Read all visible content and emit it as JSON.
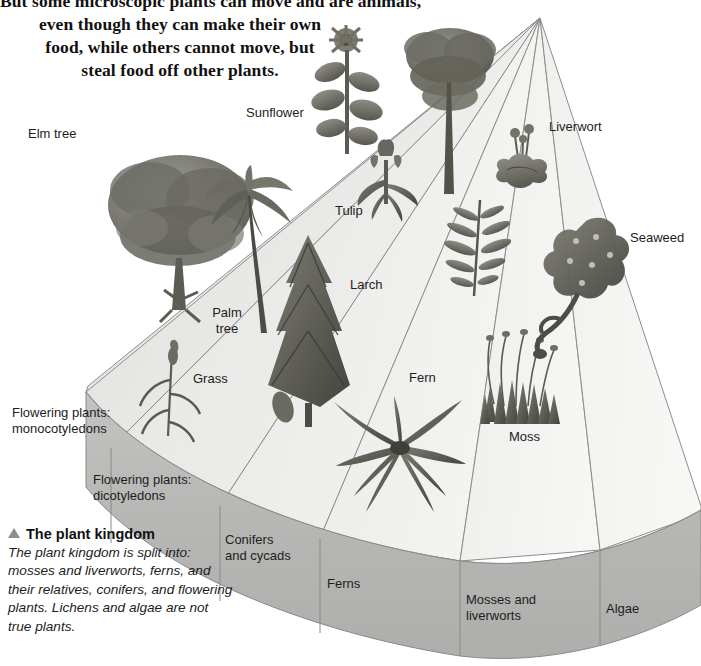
{
  "intro": {
    "lines": [
      "But some microscopic plants can move and are animals,",
      "even though they can make their own",
      "food, while others cannot move, but",
      "steal food off other plants."
    ]
  },
  "caption": {
    "marker": "triangle-up",
    "heading": "The plant kingdom",
    "body": "The plant kingdom is split into: mosses and liverworts, ferns, and their relatives, conifers, and flowering plants. Lichens and algae are not true plants."
  },
  "diagram": {
    "type": "radial-fan-3d",
    "apex": {
      "x": 540,
      "y": 18
    },
    "plant_labels": [
      {
        "id": "elm-tree",
        "text": "Elm tree",
        "x": 28,
        "y": 130,
        "align": "left"
      },
      {
        "id": "sunflower",
        "text": "Sunflower",
        "x": 246,
        "y": 108,
        "align": "left"
      },
      {
        "id": "liverwort",
        "text": "Liverwort",
        "x": 549,
        "y": 120,
        "align": "left"
      },
      {
        "id": "tulip",
        "text": "Tulip",
        "x": 335,
        "y": 203,
        "align": "left"
      },
      {
        "id": "seaweed",
        "text": "Seaweed",
        "x": 630,
        "y": 230,
        "align": "left"
      },
      {
        "id": "larch",
        "text": "Larch",
        "x": 350,
        "y": 278,
        "align": "left"
      },
      {
        "id": "palm-tree",
        "text": "Palm\ntree",
        "x": 216,
        "y": 312,
        "align": "center"
      },
      {
        "id": "grass",
        "text": "Grass",
        "x": 193,
        "y": 371,
        "align": "left"
      },
      {
        "id": "fern",
        "text": "Fern",
        "x": 409,
        "y": 370,
        "align": "left"
      },
      {
        "id": "moss",
        "text": "Moss",
        "x": 509,
        "y": 430,
        "align": "left"
      }
    ],
    "segments": [
      {
        "id": "flowering-monocotyledons",
        "text": "Flowering plants:\nmonocotyledons",
        "x": 12,
        "y": 408,
        "align": "left"
      },
      {
        "id": "flowering-dicotyledons",
        "text": "Flowering plants:\ndicotyledons",
        "x": 93,
        "y": 474,
        "align": "left"
      },
      {
        "id": "conifers-cycads",
        "text": "Conifers\nand cycads",
        "x": 225,
        "y": 535,
        "align": "left"
      },
      {
        "id": "ferns",
        "text": "Ferns",
        "x": 327,
        "y": 578,
        "align": "left"
      },
      {
        "id": "mosses-liverworts",
        "text": "Mosses and\nliverworts",
        "x": 466,
        "y": 594,
        "align": "left"
      },
      {
        "id": "algae",
        "text": "Algae",
        "x": 606,
        "y": 603,
        "align": "left"
      }
    ],
    "colors": {
      "fan_top_light": "#f2f2f0",
      "fan_top_mid": "#e4e4e1",
      "fan_top_shadow": "#d4d4d1",
      "band_front": "#b9b9b7",
      "band_front_dark": "#a8a8a6",
      "band_left_face": "#9e9e9c",
      "outline": "#8a8a88",
      "text": "#1d1d1d",
      "background": "#ffffff"
    }
  }
}
